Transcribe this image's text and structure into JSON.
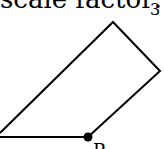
{
  "caption": {
    "text": "scale factor:",
    "value": "3"
  },
  "figure": {
    "type": "polygon",
    "stroke_color": "#000000",
    "vertices": [
      [
        0,
        133
      ],
      [
        113,
        22
      ],
      [
        160,
        71
      ],
      [
        88,
        137
      ]
    ],
    "base_segment": [
      [
        0,
        137
      ],
      [
        88,
        137
      ]
    ],
    "point": {
      "x": 88,
      "y": 137,
      "label": "P"
    }
  }
}
